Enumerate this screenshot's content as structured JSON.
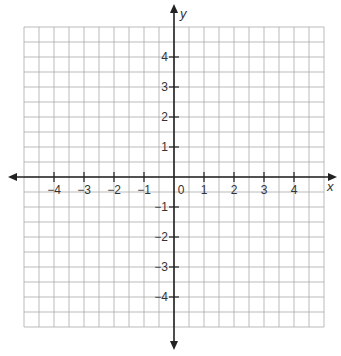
{
  "chart_data": {
    "type": "scatter",
    "title": "",
    "xlabel": "x",
    "ylabel": "y",
    "xlim": [
      -5,
      5
    ],
    "ylim": [
      -5,
      5
    ],
    "grid": true,
    "grid_step": 0.5,
    "x_ticks": [
      -4,
      -3,
      -2,
      -1,
      0,
      1,
      2,
      3,
      4
    ],
    "x_tick_labels": [
      "−4",
      "−3",
      "−2",
      "−1",
      "0",
      "1",
      "2",
      "3",
      "4"
    ],
    "y_ticks": [
      4,
      3,
      2,
      1,
      -1,
      -2,
      -3,
      -4
    ],
    "y_tick_labels": [
      "4",
      "3",
      "2",
      "1",
      "−1",
      "−2",
      "−3",
      "−4"
    ],
    "series": [],
    "legend": null
  },
  "colors": {
    "grid": "#aaaaaa",
    "axis": "#222222",
    "text": "#333333"
  }
}
